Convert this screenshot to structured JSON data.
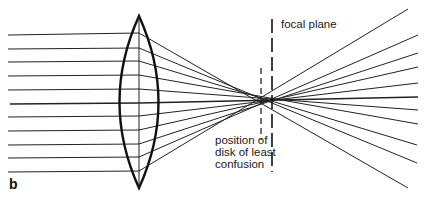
{
  "figure": {
    "panel_label": "b",
    "labels": {
      "focal_plane": "focal plane",
      "disk_line1": "position of",
      "disk_line2": "disk of least",
      "disk_line3": "confusion"
    },
    "colors": {
      "ink": "#1a1a1a",
      "background": "#ffffff"
    }
  }
}
